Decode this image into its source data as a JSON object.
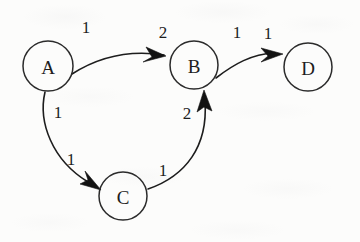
{
  "diagram": {
    "type": "directed-weighted-graph",
    "title": "",
    "background_color": "#fcfcfb",
    "ink_color": "#1d1d1d",
    "nodes": [
      {
        "id": "A",
        "label": "A",
        "cx": 48,
        "cy": 66,
        "r": 25
      },
      {
        "id": "B",
        "label": "B",
        "cx": 194,
        "cy": 65,
        "r": 24
      },
      {
        "id": "C",
        "label": "C",
        "cx": 123,
        "cy": 196,
        "r": 24
      },
      {
        "id": "D",
        "label": "D",
        "cx": 308,
        "cy": 67,
        "r": 24
      }
    ],
    "edges": [
      {
        "id": "a-to-b",
        "from": "A",
        "to": "B",
        "labels": [
          "1",
          "2"
        ],
        "label_positions": [
          {
            "x": 86,
            "y": 27
          },
          {
            "x": 163,
            "y": 32
          }
        ],
        "path": "M 72,74 C 100,56 132,50 164,55",
        "arrow": "M 166,56 L 146,47 L 152,57 L 143,62 Z"
      },
      {
        "id": "b-to-d",
        "from": "B",
        "to": "D",
        "labels": [
          "1",
          "1"
        ],
        "label_positions": [
          {
            "x": 237,
            "y": 32
          },
          {
            "x": 268,
            "y": 33
          }
        ],
        "path": "M 216,78 C 234,64 252,54 274,53",
        "arrow": "M 283,54 L 261,48 L 268,56 L 261,62 Z"
      },
      {
        "id": "a-to-c",
        "from": "A",
        "to": "C",
        "labels": [
          "1",
          "1"
        ],
        "label_positions": [
          {
            "x": 58,
            "y": 112
          },
          {
            "x": 71,
            "y": 159
          }
        ],
        "path": "M 45,92 C 38,122 52,160 88,182",
        "arrow": "M 101,190 L 80,184 L 88,180 L 85,171 Z"
      },
      {
        "id": "c-to-b",
        "from": "C",
        "to": "B",
        "labels": [
          "2",
          "1"
        ],
        "label_positions": [
          {
            "x": 187,
            "y": 113
          },
          {
            "x": 163,
            "y": 170
          }
        ],
        "path": "M 148,189 C 186,176 208,146 205,102",
        "arrow": "M 204,90 L 197,112 L 204,107 L 212,111 Z"
      }
    ]
  }
}
